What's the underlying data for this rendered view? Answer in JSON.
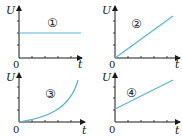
{
  "panels": [
    {
      "number_label": "①",
      "y_label": "U",
      "x_label": "t",
      "origin_label": "0",
      "curve_type": "constant"
    },
    {
      "number_label": "②",
      "y_label": "U",
      "x_label": "t",
      "origin_label": "0",
      "curve_type": "linear-through-origin"
    },
    {
      "number_label": "③",
      "y_label": "U",
      "x_label": "t",
      "origin_label": "0",
      "curve_type": "exponential-increasing"
    },
    {
      "number_label": "④",
      "y_label": "U",
      "x_label": "t",
      "origin_label": "0",
      "curve_type": "linear-with-intercept"
    }
  ],
  "colors": {
    "curve": "#5bb4d4",
    "axis": "#1a1a1a"
  }
}
